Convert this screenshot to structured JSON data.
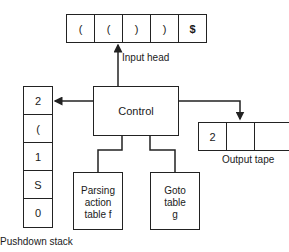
{
  "input_tape": {
    "cells": [
      "(",
      "(",
      ")",
      ")",
      "$"
    ],
    "label": "Input head"
  },
  "control": {
    "label": "Control"
  },
  "stack": {
    "cells": [
      "2",
      "(",
      "1",
      "S",
      "0"
    ],
    "label": "Pushdown stack"
  },
  "output_tape": {
    "cells": [
      "2",
      "",
      ""
    ],
    "label": "Output tape"
  },
  "tables": {
    "parsing": {
      "lines": [
        "Parsing",
        "action",
        "table f"
      ]
    },
    "goto": {
      "lines": [
        "Goto",
        "table",
        "g"
      ]
    }
  }
}
